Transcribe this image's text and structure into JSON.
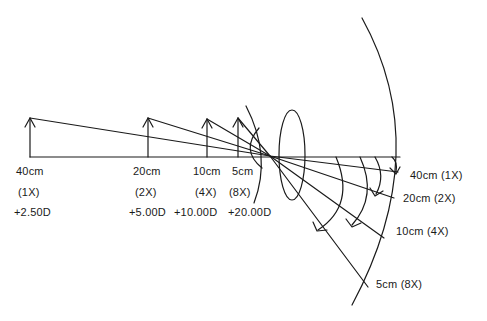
{
  "diagram": {
    "stroke_color": "#1a1a1a",
    "background": "#ffffff",
    "objects": [
      {
        "distance": "40cm",
        "magnification": "(1X)",
        "power": "+2.50D"
      },
      {
        "distance": "20cm",
        "magnification": "(2X)",
        "power": "+5.00D"
      },
      {
        "distance": "10cm",
        "magnification": "(4X)",
        "power": "+10.00D"
      },
      {
        "distance": "5cm",
        "magnification": "(8X)",
        "power": "+20.00D"
      }
    ],
    "retina_labels": [
      {
        "text": "40cm (1X)"
      },
      {
        "text": "20cm (2X)"
      },
      {
        "text": "10cm (4X)"
      },
      {
        "text": "5cm (8X)"
      }
    ]
  }
}
